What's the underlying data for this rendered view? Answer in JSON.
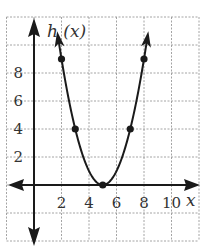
{
  "chart_data": {
    "type": "line",
    "title": "",
    "function": "h(x) = (x - 5)^2",
    "xlabel": "x",
    "ylabel": "h (x)",
    "xlim": [
      -2,
      12
    ],
    "ylim": [
      -4,
      12
    ],
    "grid": true,
    "grid_step": 2,
    "x_ticks": [
      2,
      4,
      6,
      8,
      10
    ],
    "x_tick_labels": [
      "2",
      "4",
      "6",
      "8",
      "10"
    ],
    "y_ticks": [
      2,
      4,
      6,
      8
    ],
    "y_tick_labels": [
      "2",
      "4",
      "6",
      "8"
    ],
    "series": [
      {
        "name": "h(x)",
        "x": [
          2,
          3,
          5,
          7,
          8
        ],
        "values": [
          9,
          4,
          0,
          4,
          9
        ],
        "marked_points": [
          [
            2,
            9
          ],
          [
            3,
            4
          ],
          [
            5,
            0
          ],
          [
            7,
            4
          ],
          [
            8,
            9
          ]
        ],
        "arrows_at_ends": true
      }
    ]
  }
}
